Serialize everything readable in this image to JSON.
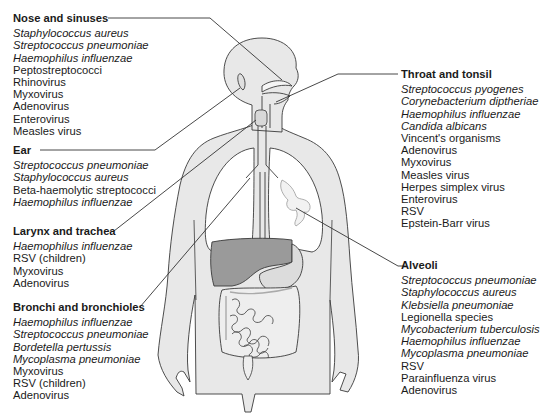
{
  "colors": {
    "body_fill": "#e8e8e8",
    "outline": "#3a3a3a",
    "liver": "#9a9a9a",
    "stomach": "#dcdcdc",
    "leader_line": "#333333",
    "text": "#1a1a1a"
  },
  "groups": {
    "nose": {
      "heading": "Nose and sinuses",
      "items": [
        {
          "name": "Staphylococcus aureus",
          "italic": true
        },
        {
          "name": "Streptococcus pneumoniae",
          "italic": true
        },
        {
          "name": "Haemophilus influenzae",
          "italic": true
        },
        {
          "name": "Peptostreptococci",
          "italic": false
        },
        {
          "name": "Rhinovirus",
          "italic": false
        },
        {
          "name": "Myxovirus",
          "italic": false
        },
        {
          "name": "Adenovirus",
          "italic": false
        },
        {
          "name": "Enterovirus",
          "italic": false
        },
        {
          "name": "Measles virus",
          "italic": false
        }
      ]
    },
    "ear": {
      "heading": "Ear",
      "items": [
        {
          "name": "Streptococcus pneumoniae",
          "italic": true
        },
        {
          "name": "Staphylococcus aureus",
          "italic": true
        },
        {
          "name": "Beta-haemolytic streptococci",
          "italic": false
        },
        {
          "name": "Haemophilus influenzae",
          "italic": true
        }
      ]
    },
    "larynx": {
      "heading": "Larynx and trachea",
      "items": [
        {
          "name": "Haemophilus influenzae",
          "italic": true
        },
        {
          "name": "RSV (children)",
          "italic": false
        },
        {
          "name": "Myxovirus",
          "italic": false
        },
        {
          "name": "Adenovirus",
          "italic": false
        }
      ]
    },
    "bronchi": {
      "heading": "Bronchi and bronchioles",
      "items": [
        {
          "name": "Haemophilus influenzae",
          "italic": true
        },
        {
          "name": "Streptococcus pneumoniae",
          "italic": true
        },
        {
          "name": "Bordetella pertussis",
          "italic": true
        },
        {
          "name": "Mycoplasma pneumoniae",
          "italic": true
        },
        {
          "name": "Myxovirus",
          "italic": false
        },
        {
          "name": "RSV (children)",
          "italic": false
        },
        {
          "name": "Adenovirus",
          "italic": false
        }
      ]
    },
    "throat": {
      "heading": "Throat and tonsil",
      "items": [
        {
          "name": "Streptococcus pyogenes",
          "italic": true
        },
        {
          "name": "Corynebacterium diptheriae",
          "italic": true
        },
        {
          "name": "Haemophilus influenzae",
          "italic": true
        },
        {
          "name": "Candida albicans",
          "italic": true
        },
        {
          "name": "Vincent's organisms",
          "italic": false
        },
        {
          "name": "Adenovirus",
          "italic": false
        },
        {
          "name": "Myxovirus",
          "italic": false
        },
        {
          "name": "Measles virus",
          "italic": false
        },
        {
          "name": "Herpes simplex virus",
          "italic": false
        },
        {
          "name": "Enterovirus",
          "italic": false
        },
        {
          "name": "RSV",
          "italic": false
        },
        {
          "name": "Epstein-Barr virus",
          "italic": false
        }
      ]
    },
    "alveoli": {
      "heading": "Alveoli",
      "items": [
        {
          "name": "Streptococcus pneumoniae",
          "italic": true
        },
        {
          "name": "Staphylococcus aureus",
          "italic": true
        },
        {
          "name": "Klebsiella pneumoniae",
          "italic": true
        },
        {
          "name": "Legionella species",
          "italic": false
        },
        {
          "name": "Mycobacterium tuberculosis",
          "italic": true
        },
        {
          "name": "Haemophilus influenzae",
          "italic": true
        },
        {
          "name": "Mycoplasma pneumoniae",
          "italic": true
        },
        {
          "name": "RSV",
          "italic": false
        },
        {
          "name": "Parainfluenza virus",
          "italic": false
        },
        {
          "name": "Adenovirus",
          "italic": false
        }
      ]
    }
  }
}
